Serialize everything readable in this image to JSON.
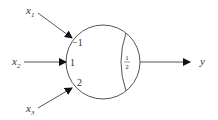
{
  "diagram": {
    "type": "perceptron / threshold neuron",
    "inputs": [
      {
        "name": "x",
        "sub": "1",
        "weight": "−1"
      },
      {
        "name": "x",
        "sub": "2",
        "weight": "1"
      },
      {
        "name": "x",
        "sub": "3",
        "weight": "2"
      }
    ],
    "threshold": {
      "num": "1",
      "den": "2"
    },
    "output": "y",
    "colors": {
      "stroke": "#555555",
      "text": "#333333"
    }
  }
}
